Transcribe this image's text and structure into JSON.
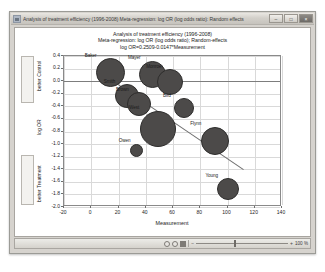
{
  "window": {
    "title": "Analysis of treatment efficiency (1996-2008) Meta-regression: log OR (log odds ratio): Random effects",
    "icon": "chart-window-icon",
    "minimize_label": "–",
    "maximize_label": "□",
    "close_label": "×"
  },
  "statusbar": {
    "view_normal_icon": "normal-view-icon",
    "view_page_icon": "page-view-icon",
    "view_draft_icon": "draft-view-icon",
    "zoom_out_label": "−",
    "zoom_in_label": "+",
    "zoom_value": "100 %"
  },
  "chart_data": {
    "type": "scatter",
    "title": "Analysis of treatment efficiency (1996-2008)",
    "subtitle": "Meta-regression: log OR (log odds ratio); Random-effects",
    "equation": "log OR=0.2509-0.0147*Measurement",
    "xlabel": "Measurement",
    "ylabel": "log OR",
    "ylabel_top": "better\nControl",
    "ylabel_top_line1": "better",
    "ylabel_top_line2": "Control",
    "ylabel_bottom_line1": "better",
    "ylabel_bottom_line2": "Treatment",
    "xlim": [
      -20,
      140
    ],
    "ylim": [
      -2.0,
      0.4
    ],
    "xticks": [
      -20,
      0,
      20,
      40,
      60,
      80,
      100,
      120,
      140
    ],
    "xtick_labels": [
      "-20",
      "0",
      "20",
      "40",
      "60",
      "80",
      "100",
      "120",
      "140"
    ],
    "yticks": [
      0.4,
      0.2,
      0.0,
      -0.2,
      -0.4,
      -0.6,
      -0.8,
      -1.0,
      -1.2,
      -1.4,
      -1.6,
      -1.8,
      -2.0
    ],
    "ytick_labels": [
      "0.4",
      "0.2",
      "0.0",
      "-0.2",
      "-0.4",
      "-0.6",
      "-0.8",
      "-1.0",
      "-1.2",
      "-1.4",
      "-1.6",
      "-1.8",
      "-2.0"
    ],
    "grid": true,
    "legend": "none",
    "zero_line": 0.0,
    "regression": {
      "intercept": 0.2509,
      "slope": -0.0147,
      "x_start": 6,
      "x_end": 112
    },
    "bubble_color": "#4c4a49",
    "points": [
      {
        "label": "Baker",
        "x": 14,
        "y": 0.13,
        "size": 29
      },
      {
        "label": "Smith",
        "x": 26,
        "y": -0.24,
        "size": 24
      },
      {
        "label": "Mayer",
        "x": 45,
        "y": 0.11,
        "size": 27
      },
      {
        "label": "Brown",
        "x": 35,
        "y": -0.37,
        "size": 24
      },
      {
        "label": "Monroe",
        "x": 58,
        "y": -0.02,
        "size": 26
      },
      {
        "label": "West",
        "x": 49,
        "y": -0.76,
        "size": 36
      },
      {
        "label": "Bird",
        "x": 68,
        "y": -0.43,
        "size": 20
      },
      {
        "label": "Owen",
        "x": 33,
        "y": -1.1,
        "size": 13
      },
      {
        "label": "Flynn",
        "x": 91,
        "y": -0.95,
        "size": 28
      },
      {
        "label": "Young",
        "x": 100,
        "y": -1.72,
        "size": 22
      }
    ]
  }
}
